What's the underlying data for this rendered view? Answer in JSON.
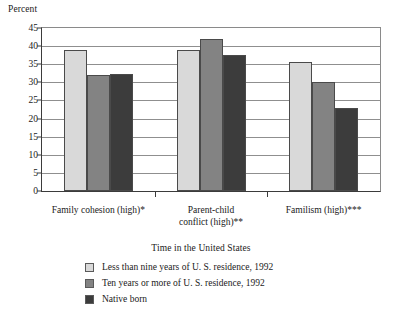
{
  "chart_data": {
    "type": "bar",
    "title": "",
    "xlabel": "",
    "ylabel": "Percent",
    "ylim": [
      0,
      45
    ],
    "yticks": [
      0,
      5,
      10,
      15,
      20,
      25,
      30,
      35,
      40,
      45
    ],
    "grid": true,
    "legend_position": "bottom-center",
    "legend_title": "Time in the United States",
    "categories": [
      "Family cohesion (high)*",
      "Parent-child\nconflict (high)**",
      "Familism (high)***"
    ],
    "series": [
      {
        "name": "Less than nine years of U. S. residence, 1992",
        "color": "#d9d9d9",
        "values": [
          38.8,
          38.8,
          35.5
        ]
      },
      {
        "name": "Ten years or more of U. S. residence, 1992",
        "color": "#838383",
        "values": [
          32.0,
          42.0,
          30.0
        ]
      },
      {
        "name": "Native born",
        "color": "#3c3c3c",
        "values": [
          32.2,
          37.5,
          23.0
        ]
      }
    ]
  },
  "axis": {
    "y_title": "Percent",
    "y_tick_labels": [
      "45",
      "40",
      "35",
      "30",
      "25",
      "20",
      "15",
      "10",
      "5",
      "0"
    ]
  },
  "legend": {
    "title": "Time in the United States",
    "items": [
      {
        "label": "Less than nine years of U. S. residence, 1992",
        "swatch": "light-gray-swatch"
      },
      {
        "label": "Ten years or more of U. S. residence, 1992",
        "swatch": "medium-gray-swatch"
      },
      {
        "label": "Native born",
        "swatch": "dark-gray-swatch"
      }
    ]
  },
  "categories": [
    {
      "label": "Family cohesion (high)*"
    },
    {
      "label": "Parent-child\nconflict (high)**"
    },
    {
      "label": "Familism (high)***"
    }
  ]
}
